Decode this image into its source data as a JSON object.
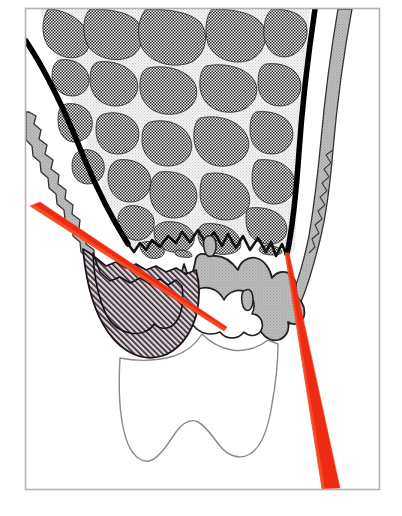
{
  "figure": {
    "frame": {
      "border_color": "#b3b3b3",
      "background_color": "#ffffff",
      "x": 25,
      "y": 8,
      "width": 355,
      "height": 482
    },
    "colors": {
      "outline_black": "#1a1a1a",
      "cortical_black_band": "#000000",
      "trabecular_fill": "#6e6e6e",
      "marrow_light": "#ededed",
      "gingiva_gray": "#b8b8b8",
      "gingiva_gray_dark": "#9a9a9a",
      "lesion_hatch_bg": "#ded6dc",
      "lesion_hatch_line": "#2a2026",
      "probe_red": "#ee2a12",
      "probe_red_light": "#fb6a3a",
      "crown_outline": "#8a8a8a",
      "frame_border": "#b3b3b3"
    },
    "structures": [
      {
        "id": "cortical-bone-plate",
        "label": "Cortical bone plate",
        "fill": "#ededed"
      },
      {
        "id": "trabecular-bone",
        "label": "Trabecular (cancellous) bone",
        "fill": "#6e6e6e"
      },
      {
        "id": "lamina-dura-band",
        "label": "Lamina dura / cortical black band",
        "fill": "#000000"
      },
      {
        "id": "periodontal-ligament-space",
        "label": "Periodontal ligament space",
        "fill": "#ffffff"
      },
      {
        "id": "gingiva-left",
        "label": "Left gingival margin",
        "fill": "#b8b8b8"
      },
      {
        "id": "gingiva-right",
        "label": "Right gingival margin",
        "fill": "#b8b8b8"
      },
      {
        "id": "interdental-tissue",
        "label": "Interdental soft tissue",
        "fill": "#b8b8b8"
      },
      {
        "id": "infrabony-defect",
        "label": "Infrabony defect (hatched)",
        "fill": "#ded6dc"
      },
      {
        "id": "tooth-crown",
        "label": "Tooth crown outline",
        "fill": "#ffffff"
      }
    ],
    "probes": [
      {
        "id": "probe-left",
        "label": "Left probe angle indicator",
        "color": "#ee2a12",
        "start": {
          "x": 33,
          "y": 211
        },
        "end": {
          "x": 224,
          "y": 330
        },
        "thickness_start": 13,
        "thickness_end": 1
      },
      {
        "id": "probe-right",
        "label": "Right probe angle indicator",
        "color": "#ee2a12",
        "start": {
          "x": 286,
          "y": 254
        },
        "end": {
          "x": 330,
          "y": 487
        },
        "thickness_start": 2,
        "thickness_end": 14
      }
    ]
  }
}
